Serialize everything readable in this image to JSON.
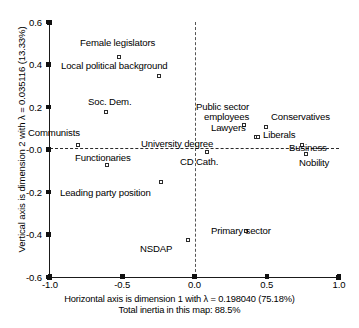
{
  "chart_data": {
    "type": "scatter",
    "title": "",
    "xlabel": "Horizontal axis is dimension 1 with λ = 0.198040 (75.18%)",
    "xlabel_line2": "Total inertia in this map: 88.5%",
    "ylabel": "Vertical axis is dimension 2 with λ = 0.035116 (13.33%)",
    "xlim": [
      -1.0,
      1.0
    ],
    "ylim": [
      -0.6,
      0.6
    ],
    "xticks": [
      "-1.0",
      "-0.5",
      "0.0",
      "0.5",
      "1.0"
    ],
    "xtick_values": [
      -1.0,
      -0.5,
      0.0,
      0.5,
      1.0
    ],
    "yticks": [
      "0.6",
      "0.4",
      "0.2",
      "-0.0",
      "-0.2",
      "-0.4",
      "-0.6"
    ],
    "ytick_values": [
      0.6,
      0.4,
      0.2,
      0.0,
      -0.2,
      -0.4,
      -0.6
    ],
    "grid": false,
    "reference_lines": {
      "horizontal_at": 0.0,
      "vertical_at": 0.0,
      "style": "dashed"
    },
    "marker": "open-square",
    "legend": "none",
    "points": [
      {
        "label": "Female legislators",
        "x": -0.52,
        "y": 0.435
      },
      {
        "label": "Local political background",
        "x": -0.245,
        "y": 0.345
      },
      {
        "label": "Soc. Dem.",
        "x": -0.615,
        "y": 0.175
      },
      {
        "label": "Public sector employees",
        "x": 0.345,
        "y": 0.115
      },
      {
        "label": "Conservatives",
        "x": 0.495,
        "y": 0.105
      },
      {
        "label": "Lawyers",
        "x": 0.425,
        "y": 0.06
      },
      {
        "label": "Liberals",
        "x": 0.44,
        "y": 0.058
      },
      {
        "label": "Communists",
        "x": -0.805,
        "y": 0.02
      },
      {
        "label": "Business",
        "x": 0.745,
        "y": 0.022
      },
      {
        "label": "University degree",
        "x": 0.085,
        "y": -0.012
      },
      {
        "label": "CD Cath.",
        "x": 0.085,
        "y": -0.012
      },
      {
        "label": "Nobility",
        "x": 0.775,
        "y": -0.022
      },
      {
        "label": "Functionaries",
        "x": -0.605,
        "y": -0.072
      },
      {
        "label": "Leading party position",
        "x": -0.235,
        "y": -0.155
      },
      {
        "label": "Primary sector",
        "x": 0.355,
        "y": -0.385
      },
      {
        "label": "NSDAP",
        "x": -0.045,
        "y": -0.425
      }
    ],
    "labels": [
      {
        "text": "Female legislators",
        "left": 80,
        "top": 38,
        "wrap": false
      },
      {
        "text": "Local political background",
        "left": 61,
        "top": 61,
        "wrap": false
      },
      {
        "text": "Soc. Dem.",
        "left": 88,
        "top": 97,
        "wrap": false
      },
      {
        "text": "Public sector",
        "left": 196,
        "top": 102,
        "wrap": false
      },
      {
        "text": "employees",
        "left": 204,
        "top": 112,
        "wrap": false
      },
      {
        "text": "Conservatives",
        "left": 271,
        "top": 112,
        "wrap": false
      },
      {
        "text": "Lawyers",
        "left": 211,
        "top": 123,
        "wrap": false
      },
      {
        "text": "Liberals",
        "left": 263,
        "top": 130,
        "wrap": false
      },
      {
        "text": "Communists",
        "left": 28,
        "top": 128,
        "wrap": false
      },
      {
        "text": "University degree",
        "left": 141,
        "top": 139,
        "wrap": false
      },
      {
        "text": "Business",
        "left": 289,
        "top": 143,
        "wrap": false
      },
      {
        "text": "CD Cath.",
        "left": 180,
        "top": 157,
        "wrap": false
      },
      {
        "text": "Nobility",
        "left": 299,
        "top": 158,
        "wrap": false
      },
      {
        "text": "Functionaries",
        "left": 75,
        "top": 153,
        "wrap": false
      },
      {
        "text": "Leading party position",
        "left": 60,
        "top": 188,
        "wrap": false
      },
      {
        "text": "Primary sector",
        "left": 211,
        "top": 226,
        "wrap": false
      },
      {
        "text": "NSDAP",
        "left": 140,
        "top": 244,
        "wrap": false
      }
    ]
  },
  "axes": {
    "y_title": "Vertical axis is dimension 2 with λ = 0.035116 (13.33%)",
    "x_title_line1": "Horizontal axis is dimension 1 with λ = 0.198040 (75.18%)",
    "x_title_line2": "Total inertia in this map: 88.5%"
  },
  "colors": {
    "axis": "#1a1a1a",
    "marker_stroke": "#2b2b2b",
    "reference_dash": "#2a2a2a",
    "background": "#ffffff",
    "text": "#000000"
  }
}
